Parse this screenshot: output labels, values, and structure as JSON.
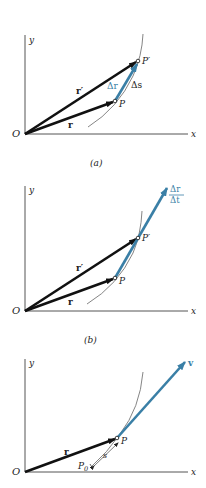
{
  "colors": {
    "vector_black": "#111111",
    "vector_blue": "#3a7fa6",
    "axis": "#555555",
    "curve": "#666666"
  },
  "panels": [
    {
      "caption": "(a)",
      "labels": {
        "y_axis": "y",
        "x_axis": "x",
        "origin": "O",
        "r": "r",
        "r_prime": "r′",
        "P": "P",
        "P_prime": "P′",
        "delta_r": "Δr",
        "delta_s": "Δs"
      }
    },
    {
      "caption": "(b)",
      "labels": {
        "y_axis": "y",
        "x_axis": "x",
        "origin": "O",
        "r": "r",
        "r_prime": "r′",
        "P": "P",
        "P_prime": "P′",
        "frac_num": "Δr",
        "frac_den": "Δt"
      }
    },
    {
      "caption": "",
      "labels": {
        "y_axis": "y",
        "x_axis": "x",
        "origin": "O",
        "r": "r",
        "P": "P",
        "P0_main": "P",
        "P0_sub": "0",
        "s": "s",
        "v": "v"
      }
    }
  ]
}
